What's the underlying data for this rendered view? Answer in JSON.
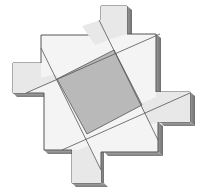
{
  "figure": {
    "description": "Isometric tile figure: pinwheel-shaped slab with a central tilted gray square",
    "colors": {
      "background": "#ffffff",
      "face": "#f4f4f4",
      "arm_face": "#e6e6e6",
      "center_square": "#b9b9b9",
      "edge_shadow": "#8a8a8a",
      "outline": "#555555"
    }
  }
}
